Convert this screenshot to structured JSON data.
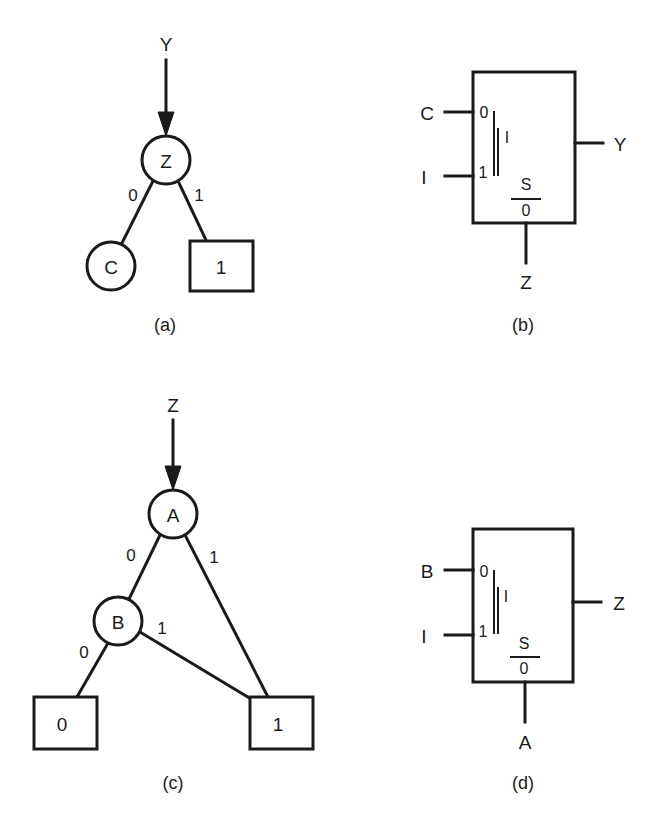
{
  "figure": {
    "panels": [
      {
        "caption": "(a)",
        "type": "bdd",
        "input_label": "Y",
        "root": {
          "label": "Z"
        },
        "edges": [
          {
            "from": "Z",
            "to": "C",
            "label": "0"
          },
          {
            "from": "Z",
            "to": "1",
            "label": "1"
          }
        ],
        "leaf_circle": {
          "label": "C"
        },
        "terminals": [
          {
            "label": "1"
          }
        ]
      },
      {
        "caption": "(b)",
        "type": "multiplexer",
        "inputs": [
          {
            "signal": "C",
            "pin": "0"
          },
          {
            "signal": "I",
            "pin": "1"
          }
        ],
        "internal_mark": "I",
        "select": {
          "numerator": "S",
          "denominator": "0",
          "signal": "Z"
        },
        "output": "Y"
      },
      {
        "caption": "(c)",
        "type": "bdd",
        "input_label": "Z",
        "root": {
          "label": "A"
        },
        "inner": {
          "label": "B"
        },
        "edges": [
          {
            "from": "A",
            "to": "B",
            "label": "0"
          },
          {
            "from": "A",
            "to": "1",
            "label": "1"
          },
          {
            "from": "B",
            "to": "0",
            "label": "0"
          },
          {
            "from": "B",
            "to": "1",
            "label": "1"
          }
        ],
        "terminals": [
          {
            "label": "0"
          },
          {
            "label": "1"
          }
        ]
      },
      {
        "caption": "(d)",
        "type": "multiplexer",
        "inputs": [
          {
            "signal": "B",
            "pin": "0"
          },
          {
            "signal": "I",
            "pin": "1"
          }
        ],
        "internal_mark": "I",
        "select": {
          "numerator": "S",
          "denominator": "0",
          "signal": "A"
        },
        "output": "Z"
      }
    ]
  }
}
